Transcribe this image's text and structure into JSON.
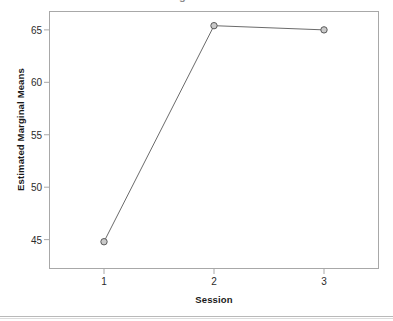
{
  "figure": {
    "background_color": "#ffffff",
    "frame_color": "#a8a8a8",
    "cut_off_title": "Estimated Marginal Means of Score"
  },
  "chart_data": {
    "type": "line",
    "title": "",
    "xlabel": "Session",
    "ylabel": "Estimated Marginal Means",
    "x": [
      1,
      2,
      3
    ],
    "categories": [
      "1",
      "2",
      "3"
    ],
    "values": [
      44.8,
      65.4,
      65.0
    ],
    "series": [
      {
        "name": "Estimated Marginal Means",
        "values": [
          44.8,
          65.4,
          65.0
        ],
        "line_color": "#6b6b6b",
        "marker": "open-circle",
        "marker_edge_color": "#5a5a5a",
        "marker_face_color": "#c9c9c9"
      }
    ],
    "xlim": [
      0.5,
      3.5
    ],
    "ylim": [
      42.2,
      66.8
    ],
    "xticks": [
      1,
      2,
      3
    ],
    "xtick_labels": [
      "1",
      "2",
      "3"
    ],
    "yticks": [
      45,
      50,
      55,
      60,
      65
    ],
    "ytick_labels": [
      "45",
      "50",
      "55",
      "60",
      "65"
    ],
    "grid": false,
    "legend": false,
    "legend_position": "none",
    "annotations": []
  },
  "axis": {
    "y": {
      "label": "Estimated Marginal Means",
      "ticks": [
        {
          "value": 65,
          "label": "65"
        },
        {
          "value": 60,
          "label": "60"
        },
        {
          "value": 55,
          "label": "55"
        },
        {
          "value": 50,
          "label": "50"
        },
        {
          "value": 45,
          "label": "45"
        }
      ]
    },
    "x": {
      "label": "Session",
      "ticks": [
        {
          "value": 1,
          "label": "1"
        },
        {
          "value": 2,
          "label": "2"
        },
        {
          "value": 3,
          "label": "3"
        }
      ]
    }
  }
}
